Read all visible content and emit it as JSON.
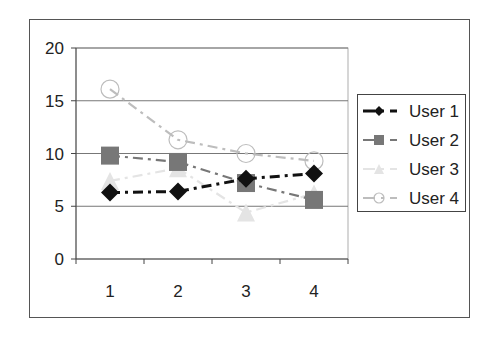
{
  "chart_data": {
    "type": "line",
    "title": "",
    "xlabel": "",
    "ylabel": "",
    "categories": [
      "1",
      "2",
      "3",
      "4"
    ],
    "ylim": [
      0,
      20
    ],
    "yticks": [
      0,
      5,
      10,
      15,
      20
    ],
    "grid": true,
    "legend_position": "right",
    "series": [
      {
        "name": "User 1",
        "values": [
          6.3,
          6.4,
          7.6,
          8.1
        ],
        "color": "#111111",
        "marker": "diamond",
        "line_style": "dash-dot"
      },
      {
        "name": "User 2",
        "values": [
          9.8,
          9.2,
          7.2,
          5.6
        ],
        "color": "#777777",
        "marker": "square",
        "line_style": "dash-dot"
      },
      {
        "name": "User 3",
        "values": [
          7.4,
          8.6,
          4.4,
          6.2
        ],
        "color": "#e4e4e4",
        "marker": "triangle",
        "line_style": "dash-dot"
      },
      {
        "name": "User 4",
        "values": [
          16.1,
          11.3,
          10.0,
          9.3
        ],
        "color": "#bdbdbd",
        "marker": "circle",
        "line_style": "dash-dot"
      }
    ]
  },
  "legend": {
    "items": [
      "User 1",
      "User 2",
      "User 3",
      "User 4"
    ]
  },
  "axes": {
    "y_tick_labels": [
      "0",
      "5",
      "10",
      "15",
      "20"
    ],
    "x_tick_labels": [
      "1",
      "2",
      "3",
      "4"
    ]
  }
}
